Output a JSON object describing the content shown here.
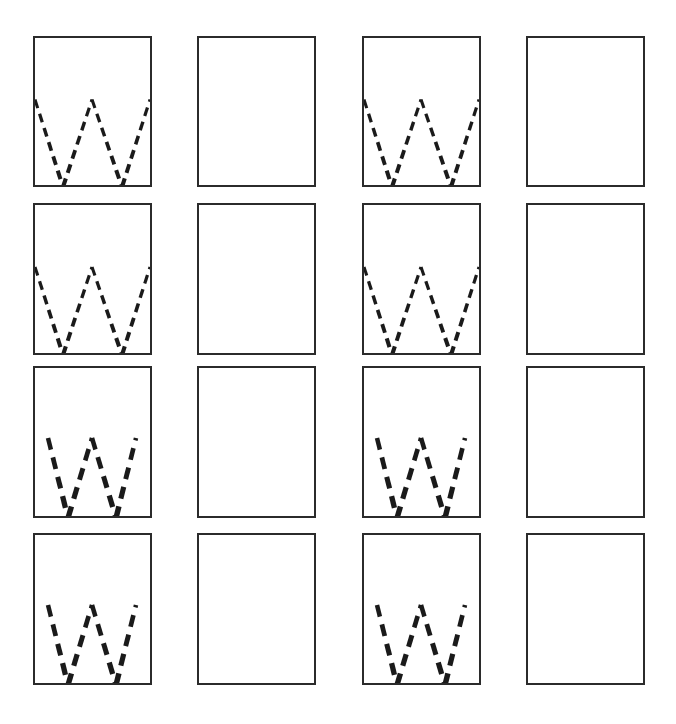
{
  "figure": {
    "rows": 4,
    "columns": 4,
    "stroke_color": "#1a1a1a",
    "border_color": "#2b2b2b",
    "background_color": "#ffffff",
    "panels": [
      {
        "row": 1,
        "col": 1,
        "content": "w-pattern",
        "style": "wide-tapered-dashes"
      },
      {
        "row": 1,
        "col": 2,
        "content": "empty"
      },
      {
        "row": 1,
        "col": 3,
        "content": "w-pattern",
        "style": "wide-tapered-dashes"
      },
      {
        "row": 1,
        "col": 4,
        "content": "empty"
      },
      {
        "row": 2,
        "col": 1,
        "content": "w-pattern",
        "style": "wide-tapered-dashes"
      },
      {
        "row": 2,
        "col": 2,
        "content": "empty"
      },
      {
        "row": 2,
        "col": 3,
        "content": "w-pattern",
        "style": "wide-tapered-dashes"
      },
      {
        "row": 2,
        "col": 4,
        "content": "empty"
      },
      {
        "row": 3,
        "col": 1,
        "content": "w-pattern",
        "style": "narrow-thick-dashes"
      },
      {
        "row": 3,
        "col": 2,
        "content": "empty"
      },
      {
        "row": 3,
        "col": 3,
        "content": "w-pattern",
        "style": "narrow-thick-dashes"
      },
      {
        "row": 3,
        "col": 4,
        "content": "empty"
      },
      {
        "row": 4,
        "col": 1,
        "content": "w-pattern",
        "style": "narrow-thick-dashes"
      },
      {
        "row": 4,
        "col": 2,
        "content": "empty"
      },
      {
        "row": 4,
        "col": 3,
        "content": "w-pattern",
        "style": "narrow-thick-dashes"
      },
      {
        "row": 4,
        "col": 4,
        "content": "empty"
      }
    ]
  }
}
